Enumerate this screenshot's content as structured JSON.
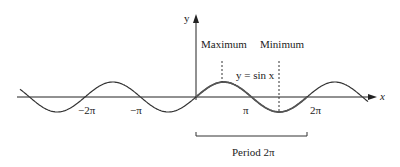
{
  "axes": {
    "x_label": "x",
    "y_label": "y"
  },
  "ticks": [
    {
      "label": "−2π",
      "value": "-2pi"
    },
    {
      "label": "−π",
      "value": "-pi"
    },
    {
      "label": "π",
      "value": "pi"
    },
    {
      "label": "2π",
      "value": "2pi"
    }
  ],
  "annotations": {
    "maximum": "Maximum",
    "minimum": "Minimum",
    "curve_label": "y = sin x",
    "period": "Period 2π"
  },
  "colors": {
    "curve": "#333333",
    "highlight": "#666666",
    "axis": "#222222"
  }
}
